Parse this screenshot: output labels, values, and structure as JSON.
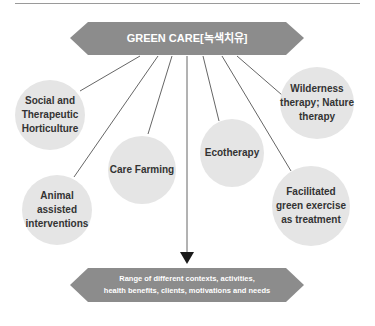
{
  "diagram": {
    "top_banner": {
      "label": "GREEN CARE[녹색치유]"
    },
    "nodes": [
      {
        "id": "social",
        "label": "Social and Therapeutic Horticulture"
      },
      {
        "id": "animal",
        "label": "Animal assisted interventions"
      },
      {
        "id": "care-farming",
        "label": "Care Farming"
      },
      {
        "id": "ecotherapy",
        "label": "Ecotherapy"
      },
      {
        "id": "wilderness",
        "label": "Wilderness therapy; Nature therapy"
      },
      {
        "id": "facilitated",
        "label": "Facilitated green exercise as treatment"
      }
    ],
    "bottom_banner": {
      "line1": "Range of different contexts, activities,",
      "line2": "health benefits, clients, motivations and needs"
    },
    "colors": {
      "banner": "#8c8c8c",
      "node_fill": "#e5e5e5",
      "line": "#555555",
      "text_dark": "#333333"
    }
  }
}
